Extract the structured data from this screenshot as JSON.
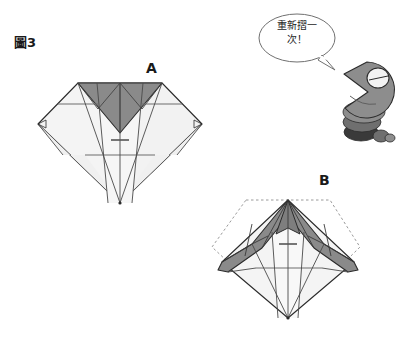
{
  "figure": {
    "number_label": "圖3",
    "panel_a_label": "A",
    "panel_b_label": "B"
  },
  "speech_bubble": {
    "line1": "重新摺一",
    "line2": "次！",
    "full_text": "重新摺一次！"
  },
  "character": {
    "name": "gray-creature-mascot"
  },
  "colors": {
    "background": "#ffffff",
    "paper_light": "#f4f4f4",
    "paper_light_2": "#efefef",
    "paper_shade_dark": "#8a8a8a",
    "paper_shade_dark_2": "#7e7e7e",
    "outline": "#2b2b2b",
    "crease": "#6d6d6d",
    "dotted_guide": "#9a9a9a",
    "text": "#1a1a1a",
    "mascot_body": "#8d8d8d",
    "mascot_dark": "#3a3a3a",
    "mascot_mid": "#6f6f6f"
  }
}
